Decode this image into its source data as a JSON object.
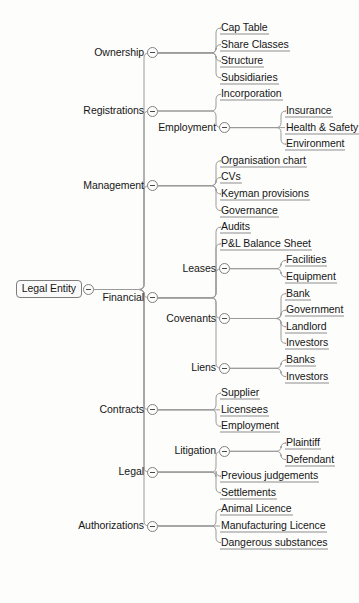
{
  "diagram": {
    "title": "Legal Entity",
    "type": "mind-map",
    "toggle_icon": "collapse-minus-icon",
    "colors": {
      "background": "#fdfdfc",
      "text": "#161616",
      "edge": "#9a9a9a",
      "leaf_underline": "#8d8d8d",
      "node_border": "#7d7d7d"
    }
  },
  "root": {
    "label": "Legal Entity",
    "children": [
      {
        "label": "Ownership",
        "children": [
          {
            "label": "Cap Table"
          },
          {
            "label": "Share Classes"
          },
          {
            "label": "Structure"
          },
          {
            "label": "Subsidiaries"
          }
        ]
      },
      {
        "label": "Registrations",
        "children": [
          {
            "label": "Incorporation"
          },
          {
            "label": "Employment",
            "children": [
              {
                "label": "Insurance"
              },
              {
                "label": "Health & Safety"
              },
              {
                "label": "Environment"
              }
            ]
          }
        ]
      },
      {
        "label": "Management",
        "children": [
          {
            "label": "Organisation chart"
          },
          {
            "label": "CVs"
          },
          {
            "label": "Keyman provisions"
          },
          {
            "label": "Governance"
          }
        ]
      },
      {
        "label": "Financial",
        "children": [
          {
            "label": "Audits"
          },
          {
            "label": "P&L Balance Sheet"
          },
          {
            "label": "Leases",
            "children": [
              {
                "label": "Facilities"
              },
              {
                "label": "Equipment"
              }
            ]
          },
          {
            "label": "Covenants",
            "children": [
              {
                "label": "Bank"
              },
              {
                "label": "Government"
              },
              {
                "label": "Landlord"
              },
              {
                "label": "Investors"
              }
            ]
          },
          {
            "label": "Liens",
            "children": [
              {
                "label": "Banks"
              },
              {
                "label": "Investors"
              }
            ]
          }
        ]
      },
      {
        "label": "Contracts",
        "children": [
          {
            "label": "Supplier"
          },
          {
            "label": "Licensees"
          },
          {
            "label": "Employment"
          }
        ]
      },
      {
        "label": "Legal",
        "children": [
          {
            "label": "Litigation",
            "children": [
              {
                "label": "Plaintiff"
              },
              {
                "label": "Defendant"
              }
            ]
          },
          {
            "label": "Previous judgements"
          },
          {
            "label": "Settlements"
          }
        ]
      },
      {
        "label": "Authorizations",
        "children": [
          {
            "label": "Animal Licence"
          },
          {
            "label": "Manufacturing Licence"
          },
          {
            "label": "Dangerous substances"
          }
        ]
      }
    ]
  },
  "layout": {
    "root_x": 88,
    "root_y": 312,
    "level_x": [
      88,
      152,
      224,
      289
    ],
    "row_height": 16.6
  }
}
